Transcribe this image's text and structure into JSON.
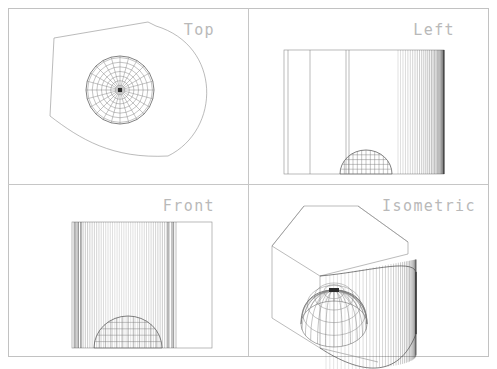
{
  "sheet": {
    "width": 497,
    "height": 369,
    "background_color": "#ffffff",
    "frame": {
      "x": 8,
      "y": 8,
      "width": 480,
      "height": 348,
      "color": "#c2c2c2"
    },
    "divider_vertical_x": 248,
    "divider_horizontal_y": 184,
    "divider_color": "#c6c6c6"
  },
  "style": {
    "label_color": "#b9b9b9",
    "outline_color": "#4a4a4a",
    "mesh_color": "#555555",
    "ruling_color": "#777777",
    "ruling_dark_color": "#3c3c3c"
  },
  "drawing": {
    "type": "orthographic-multiview",
    "projection_count": 4,
    "object": "prismatic block with cylindrical end and interior hemispherical dome"
  },
  "viewports": [
    {
      "id": "top",
      "label": "Top",
      "label_x": 215,
      "label_y": 30,
      "label_anchor": "end",
      "origin_x": 8,
      "origin_y": 8,
      "width": 240,
      "height": 176,
      "geometry": {
        "kind": "plan-outline-with-polar-sphere",
        "polygon": [
          [
            42,
            108
          ],
          [
            46,
            30
          ],
          [
            140,
            14
          ],
          [
            148,
            18
          ]
        ],
        "arc_start": [
          148,
          18
        ],
        "arc_control_1": [
          214,
          38
        ],
        "arc_control_2": [
          213,
          122
        ],
        "arc_end": [
          160,
          148
        ],
        "tail_start": [
          160,
          148
        ],
        "tail_control_1": [
          104,
          151
        ],
        "tail_control_2": [
          72,
          131
        ],
        "tail_end": [
          42,
          108
        ],
        "sphere": {
          "center_x": 112,
          "center_y": 82,
          "radius": 34,
          "meridians": 24,
          "rings": 7
        }
      }
    },
    {
      "id": "left",
      "label": "Left",
      "label_x": 455,
      "label_y": 30,
      "label_anchor": "end",
      "origin_x": 248,
      "origin_y": 8,
      "width": 240,
      "height": 176,
      "geometry": {
        "kind": "elevation-ruled-right",
        "rect": {
          "x": 36,
          "y": 42,
          "width": 160,
          "height": 124
        },
        "plain_lines_x": [
          40,
          62,
          98,
          101
        ],
        "ruling_start_x": 150,
        "ruling_end_x": 196,
        "ruling_count": 30,
        "dome": {
          "center_x": 118,
          "base_y": 166,
          "radius_x": 26,
          "radius_y": 24,
          "meridians": 12,
          "rings": 4
        }
      }
    },
    {
      "id": "front",
      "label": "Front",
      "label_x": 215,
      "label_y": 206,
      "label_anchor": "end",
      "origin_x": 8,
      "origin_y": 184,
      "width": 240,
      "height": 176,
      "geometry": {
        "kind": "elevation-ruled-full",
        "rect": {
          "x": 64,
          "y": 38,
          "width": 140,
          "height": 126
        },
        "ruling_start_x": 66,
        "ruling_end_x": 168,
        "ruling_count": 46,
        "edge_dark_x": [
          67,
          70,
          73,
          160,
          165
        ],
        "dome": {
          "center_x": 120,
          "base_y": 164,
          "radius_x": 34,
          "radius_y": 32,
          "meridians": 12,
          "rings": 4
        }
      }
    },
    {
      "id": "isometric",
      "label": "Isometric",
      "label_x": 476,
      "label_y": 206,
      "label_anchor": "end",
      "origin_x": 248,
      "origin_y": 184,
      "width": 240,
      "height": 176,
      "geometry": {
        "kind": "isometric-block-with-dome",
        "top_face": [
          [
            24,
            62
          ],
          [
            56,
            22
          ],
          [
            110,
            22
          ],
          [
            160,
            58
          ],
          [
            160,
            70
          ]
        ],
        "front_left_face": [
          [
            24,
            62
          ],
          [
            24,
            134
          ],
          [
            72,
            164
          ],
          [
            72,
            92
          ]
        ],
        "inner_edges": [
          [
            [
              24,
              62
            ],
            [
              72,
              92
            ]
          ],
          [
            [
              72,
              92
            ],
            [
              160,
              70
            ]
          ],
          [
            [
              72,
              164
            ],
            [
              130,
              178
            ]
          ],
          [
            [
              56,
              22
            ],
            [
              24,
              62
            ]
          ],
          [
            [
              110,
              22
            ],
            [
              160,
              58
            ]
          ]
        ],
        "cylinder": {
          "top_front": [
            72,
            92
          ],
          "apex": [
            160,
            62
          ],
          "right_edge_x": 168,
          "bottom_y": 186,
          "ruling_start_x": 78,
          "ruling_end_x": 168,
          "ruling_count": 38
        },
        "dome": {
          "center_x": 86,
          "center_y": 140,
          "radius_x": 33,
          "radius_y": 23,
          "height": 34,
          "meridians": 12,
          "rings": 4
        }
      }
    }
  ]
}
